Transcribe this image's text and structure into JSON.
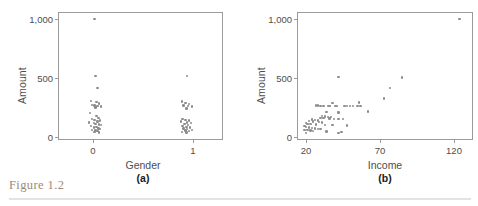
{
  "figure": {
    "caption": "Figure 1.2"
  },
  "chart_data": [
    {
      "type": "scatter",
      "panel_label": "(a)",
      "title": "",
      "xlabel": "Gender",
      "ylabel": "Amount",
      "xlim": [
        -0.38,
        1.42
      ],
      "ylim": [
        -40,
        1060
      ],
      "xticks": [
        0,
        1
      ],
      "xticklabels": [
        "0",
        "1"
      ],
      "yticks": [
        0,
        500,
        1000
      ],
      "yticklabels": [
        "0",
        "500",
        "1,000"
      ],
      "grid": false,
      "legend": "none",
      "marker_color": "#8c8c8c",
      "points": [
        [
          0.02,
          1000
        ],
        [
          0.03,
          510
        ],
        [
          0.05,
          405
        ],
        [
          -0.02,
          295
        ],
        [
          0.04,
          285
        ],
        [
          0.07,
          275
        ],
        [
          -0.01,
          262
        ],
        [
          0.02,
          258
        ],
        [
          0.05,
          252
        ],
        [
          0.09,
          248
        ],
        [
          0.03,
          240
        ],
        [
          -0.03,
          190
        ],
        [
          0.04,
          168
        ],
        [
          0.06,
          150
        ],
        [
          -0.01,
          142
        ],
        [
          0.02,
          132
        ],
        [
          0.08,
          128
        ],
        [
          0.05,
          120
        ],
        [
          -0.04,
          112
        ],
        [
          0.01,
          105
        ],
        [
          0.03,
          98
        ],
        [
          0.07,
          92
        ],
        [
          0.09,
          88
        ],
        [
          -0.02,
          80
        ],
        [
          0.04,
          72
        ],
        [
          0.01,
          66
        ],
        [
          0.06,
          60
        ],
        [
          0.08,
          54
        ],
        [
          -0.01,
          48
        ],
        [
          0.03,
          42
        ],
        [
          0.05,
          36
        ],
        [
          0.02,
          30
        ],
        [
          0.07,
          26
        ],
        [
          1.03,
          510
        ],
        [
          0.97,
          292
        ],
        [
          1.01,
          278
        ],
        [
          1.05,
          270
        ],
        [
          0.99,
          258
        ],
        [
          1.04,
          252
        ],
        [
          1.08,
          248
        ],
        [
          1.02,
          230
        ],
        [
          0.98,
          140
        ],
        [
          1.01,
          132
        ],
        [
          1.05,
          126
        ],
        [
          0.96,
          118
        ],
        [
          1.03,
          112
        ],
        [
          1.07,
          106
        ],
        [
          1.0,
          98
        ],
        [
          1.04,
          90
        ],
        [
          0.98,
          82
        ],
        [
          1.02,
          74
        ],
        [
          1.06,
          68
        ],
        [
          0.99,
          60
        ],
        [
          1.03,
          54
        ],
        [
          1.08,
          48
        ],
        [
          1.01,
          42
        ],
        [
          1.05,
          36
        ],
        [
          0.97,
          30
        ],
        [
          1.02,
          26
        ]
      ]
    },
    {
      "type": "scatter",
      "panel_label": "(b)",
      "title": "",
      "xlabel": "Income",
      "ylabel": "Amount",
      "xlim": [
        14,
        133
      ],
      "ylim": [
        -40,
        1060
      ],
      "xticks": [
        20,
        70,
        120
      ],
      "xticklabels": [
        "20",
        "70",
        "120"
      ],
      "yticks": [
        0,
        500,
        1000
      ],
      "yticklabels": [
        "0",
        "500",
        "1,000"
      ],
      "grid": false,
      "legend": "none",
      "marker_color": "#8c8c8c",
      "points": [
        [
          124,
          1000
        ],
        [
          42,
          500
        ],
        [
          85,
          497
        ],
        [
          77,
          405
        ],
        [
          73,
          318
        ],
        [
          56,
          282
        ],
        [
          38,
          278
        ],
        [
          27,
          258
        ],
        [
          28,
          255
        ],
        [
          30,
          252
        ],
        [
          32,
          250
        ],
        [
          35,
          252
        ],
        [
          36,
          250
        ],
        [
          40,
          252
        ],
        [
          41,
          250
        ],
        [
          46,
          252
        ],
        [
          48,
          250
        ],
        [
          50,
          252
        ],
        [
          52,
          250
        ],
        [
          55,
          252
        ],
        [
          57,
          250
        ],
        [
          62,
          205
        ],
        [
          34,
          198
        ],
        [
          42,
          195
        ],
        [
          31,
          168
        ],
        [
          33,
          162
        ],
        [
          35,
          158
        ],
        [
          37,
          155
        ],
        [
          30,
          150
        ],
        [
          32,
          148
        ],
        [
          36,
          145
        ],
        [
          39,
          142
        ],
        [
          42,
          140
        ],
        [
          45,
          138
        ],
        [
          24,
          135
        ],
        [
          26,
          130
        ],
        [
          28,
          128
        ],
        [
          22,
          122
        ],
        [
          25,
          118
        ],
        [
          29,
          115
        ],
        [
          31,
          112
        ],
        [
          20,
          105
        ],
        [
          21,
          100
        ],
        [
          23,
          95
        ],
        [
          27,
          92
        ],
        [
          33,
          90
        ],
        [
          38,
          88
        ],
        [
          48,
          85
        ],
        [
          19,
          78
        ],
        [
          20,
          72
        ],
        [
          22,
          68
        ],
        [
          24,
          64
        ],
        [
          26,
          60
        ],
        [
          28,
          56
        ],
        [
          30,
          52
        ],
        [
          19,
          48
        ],
        [
          21,
          44
        ],
        [
          23,
          40
        ],
        [
          25,
          36
        ],
        [
          34,
          32
        ],
        [
          44,
          28
        ],
        [
          20,
          22
        ],
        [
          42,
          18
        ]
      ]
    }
  ]
}
